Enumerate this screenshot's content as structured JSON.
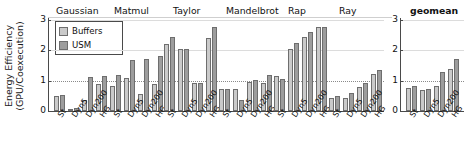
{
  "chart_data": {
    "type": "bar",
    "title": "",
    "xlabel": "",
    "ylabel_line1": "Energy Efficiency",
    "ylabel_line2": "(GPU/Coexecution)",
    "ylim": [
      0,
      3
    ],
    "yticks": [
      "0",
      "1",
      "2",
      "3"
    ],
    "ytick_values": [
      0,
      1,
      2,
      3
    ],
    "grid": true,
    "reference_line": 1,
    "legend_position": "top-left-inside",
    "legend": [
      "Buffers",
      "USM"
    ],
    "categories": [
      "St",
      "Dyn5",
      "Dyn200",
      "HG"
    ],
    "groups": [
      {
        "name": "Gaussian",
        "series": [
          {
            "name": "Buffers",
            "values": [
              0.48,
              0.07,
              0.36,
              0.88
            ]
          },
          {
            "name": "USM",
            "values": [
              0.52,
              0.09,
              1.13,
              1.16
            ]
          }
        ]
      },
      {
        "name": "Matmul",
        "series": [
          {
            "name": "Buffers",
            "values": [
              0.82,
              1.1,
              0.55,
              0.88
            ]
          },
          {
            "name": "USM",
            "values": [
              1.2,
              1.68,
              1.72,
              1.8
            ]
          }
        ]
      },
      {
        "name": "Taylor",
        "series": [
          {
            "name": "Buffers",
            "values": [
              2.2,
              2.05,
              0.93,
              2.42
            ]
          },
          {
            "name": "USM",
            "values": [
              2.45,
              2.05,
              0.93,
              2.78
            ]
          }
        ]
      },
      {
        "name": "Mandelbrot",
        "series": [
          {
            "name": "Buffers",
            "values": [
              0.72,
              0.72,
              0.96,
              0.92
            ]
          },
          {
            "name": "USM",
            "values": [
              0.72,
              0.35,
              1.02,
              1.2
            ]
          }
        ]
      },
      {
        "name": "Rap",
        "series": [
          {
            "name": "Buffers",
            "values": [
              1.15,
              2.05,
              2.45,
              2.76
            ]
          },
          {
            "name": "USM",
            "values": [
              1.05,
              2.25,
              2.6,
              2.78
            ]
          }
        ]
      },
      {
        "name": "Ray",
        "series": [
          {
            "name": "Buffers",
            "values": [
              0.43,
              0.42,
              0.78,
              1.22
            ]
          },
          {
            "name": "USM",
            "values": [
              0.5,
              0.6,
              0.92,
              1.35
            ]
          }
        ]
      }
    ],
    "geomean_panel": {
      "name": "geomean",
      "ylim": [
        0,
        3
      ],
      "yticks": [
        "0",
        "1",
        "2",
        "3"
      ],
      "categories": [
        "St",
        "Dyn5",
        "Dyn200",
        "HG"
      ],
      "series": [
        {
          "name": "Buffers",
          "values": [
            0.75,
            0.7,
            0.82,
            1.38
          ]
        },
        {
          "name": "USM",
          "values": [
            0.83,
            0.73,
            1.27,
            1.7
          ]
        }
      ]
    },
    "colors": {
      "buffers": "#cacaca",
      "usm": "#9d9d9d",
      "bar_edge": "#6e6e6e",
      "axis": "#4a4a4a",
      "grid": "#dcdcdc",
      "text": "#111111"
    }
  }
}
